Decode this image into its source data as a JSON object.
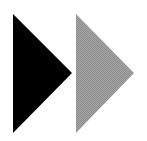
{
  "icon": {
    "name": "fast-forward",
    "colors": {
      "background": "#ffffff",
      "primary_triangle": "#000000",
      "secondary_triangle": "#9a9a9a"
    },
    "triangles": [
      {
        "name": "black-triangle",
        "points": "13,14 72,73 13,133"
      },
      {
        "name": "gray-triangle",
        "points": "76,14 134,73 76,133"
      }
    ]
  }
}
